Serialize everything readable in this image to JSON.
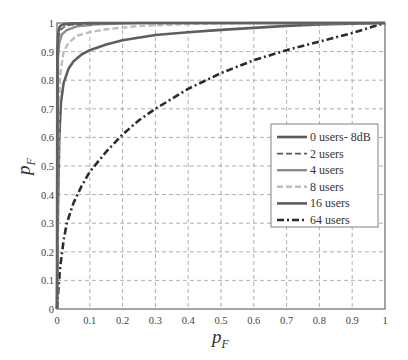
{
  "chart_data": {
    "type": "line",
    "title": "",
    "xlabel": "p_F",
    "ylabel": "p_F",
    "xlim": [
      0,
      1
    ],
    "ylim": [
      0,
      1
    ],
    "grid": true,
    "legend_position": "center-right",
    "x_ticks": [
      "0",
      "0.1",
      "0.2",
      "0.3",
      "0.4",
      "0.5",
      "0.6",
      "0.7",
      "0.8",
      "0.9",
      "1"
    ],
    "y_ticks": [
      "0",
      "0.1",
      "0.2",
      "0.3",
      "0.4",
      "0.5",
      "0.6",
      "0.7",
      "0.8",
      "0.9",
      "1"
    ],
    "series": [
      {
        "name": "0 users- 8dB",
        "style": "solid",
        "color": "#5a5a5a",
        "width": 2.6,
        "x": [
          0,
          0.001,
          0.003,
          0.006,
          0.01,
          0.02,
          0.04,
          0.1,
          0.3,
          1
        ],
        "y": [
          0,
          0.9,
          0.96,
          0.98,
          0.99,
          0.995,
          0.998,
          1,
          1,
          1
        ]
      },
      {
        "name": "2 users",
        "style": "dashed",
        "color": "#5a5a5a",
        "width": 1.6,
        "x": [
          0,
          0.002,
          0.005,
          0.01,
          0.02,
          0.04,
          0.08,
          0.2,
          1
        ],
        "y": [
          0,
          0.9,
          0.95,
          0.975,
          0.985,
          0.993,
          0.997,
          1,
          1
        ]
      },
      {
        "name": "4 users",
        "style": "solid",
        "color": "#8a8a8a",
        "width": 2.4,
        "x": [
          0,
          0.003,
          0.007,
          0.015,
          0.03,
          0.06,
          0.12,
          0.25,
          1
        ],
        "y": [
          0,
          0.88,
          0.93,
          0.96,
          0.975,
          0.988,
          0.995,
          1,
          1
        ]
      },
      {
        "name": "8 users",
        "style": "dashed",
        "color": "#bdbdbd",
        "width": 2.4,
        "x": [
          0,
          0.005,
          0.01,
          0.02,
          0.035,
          0.06,
          0.1,
          0.15,
          0.25,
          0.4,
          0.6,
          1
        ],
        "y": [
          0,
          0.7,
          0.82,
          0.9,
          0.93,
          0.955,
          0.968,
          0.978,
          0.99,
          0.996,
          1,
          1
        ]
      },
      {
        "name": "16 users",
        "style": "solid",
        "color": "#5e5e5e",
        "width": 2.6,
        "x": [
          0,
          0.003,
          0.007,
          0.012,
          0.02,
          0.035,
          0.05,
          0.075,
          0.1,
          0.15,
          0.2,
          0.3,
          0.4,
          0.5,
          0.6,
          0.7,
          0.8,
          0.9,
          1
        ],
        "y": [
          0,
          0.35,
          0.6,
          0.72,
          0.79,
          0.84,
          0.865,
          0.89,
          0.905,
          0.925,
          0.94,
          0.958,
          0.968,
          0.976,
          0.983,
          0.99,
          0.995,
          0.998,
          1
        ]
      },
      {
        "name": "64 users",
        "style": "dashdot",
        "color": "#2b2b2b",
        "width": 2.6,
        "x": [
          0,
          0.005,
          0.01,
          0.02,
          0.03,
          0.05,
          0.075,
          0.1,
          0.15,
          0.2,
          0.25,
          0.3,
          0.4,
          0.5,
          0.6,
          0.7,
          0.8,
          0.9,
          1
        ],
        "y": [
          0,
          0.08,
          0.15,
          0.24,
          0.3,
          0.37,
          0.43,
          0.48,
          0.55,
          0.61,
          0.66,
          0.7,
          0.77,
          0.825,
          0.87,
          0.905,
          0.935,
          0.965,
          1
        ]
      }
    ]
  },
  "legend": {
    "items": [
      "0 users- 8dB",
      "2 users",
      "4 users",
      "8 users",
      "16 users",
      "64 users"
    ]
  },
  "axes": {
    "xlabel_main": "p",
    "xlabel_sub": "F",
    "ylabel_main": "p",
    "ylabel_sub": "F"
  }
}
